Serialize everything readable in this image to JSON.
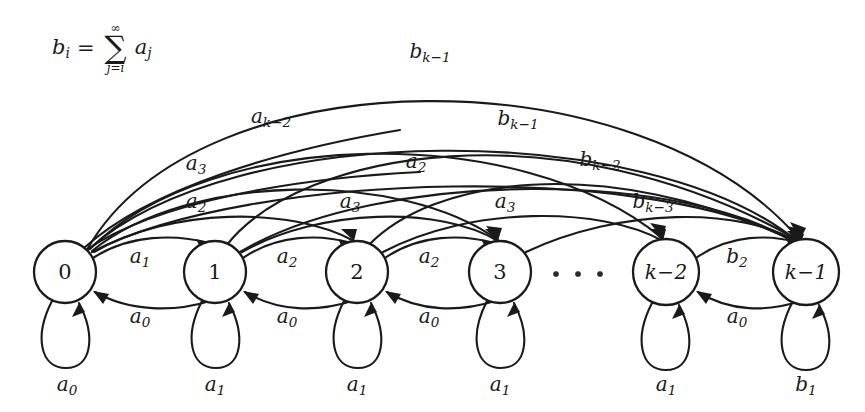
{
  "figure": {
    "background_color": "#ffffff",
    "stroke_color": "#1a1a1a"
  },
  "formula": {
    "lhs_var": "b",
    "lhs_sub": "i",
    "equals": "=",
    "sigma": "∑",
    "upper_limit": "∞",
    "lower_limit": "j=i",
    "term_var": "a",
    "term_sub": "j",
    "plain": "b_i = sum_{j=i}^{infinity} a_j"
  },
  "nodes": [
    {
      "id": "n0",
      "label": "0",
      "label_kind": "plain",
      "cx": 65,
      "cy": 272,
      "r": 31
    },
    {
      "id": "n1",
      "label": "1",
      "label_kind": "plain",
      "cx": 215,
      "cy": 272,
      "r": 31
    },
    {
      "id": "n2",
      "label": "2",
      "label_kind": "plain",
      "cx": 357,
      "cy": 272,
      "r": 31
    },
    {
      "id": "n3",
      "label": "3",
      "label_kind": "plain",
      "cx": 500,
      "cy": 272,
      "r": 31
    },
    {
      "id": "nk2",
      "label": "k−2",
      "label_kind": "math",
      "cx": 666,
      "cy": 272,
      "r": 33
    },
    {
      "id": "nk1",
      "label": "k−1",
      "label_kind": "math",
      "cx": 806,
      "cy": 272,
      "r": 33
    }
  ],
  "ellipsis": {
    "label": "· · ·",
    "dots": 3,
    "cx": 577,
    "cy": 274
  },
  "forward_edges": [
    {
      "from": "0",
      "to": "1",
      "var": "a",
      "sub": "1",
      "lx": 140,
      "ly": 258
    },
    {
      "from": "1",
      "to": "2",
      "var": "a",
      "sub": "2",
      "lx": 287,
      "ly": 258
    },
    {
      "from": "2",
      "to": "3",
      "var": "a",
      "sub": "2",
      "lx": 429,
      "ly": 258
    },
    {
      "from": "k-2",
      "to": "k-1",
      "var": "b",
      "sub": "2",
      "lx": 737,
      "ly": 258
    }
  ],
  "backward_edges": [
    {
      "from": "1",
      "to": "0",
      "var": "a",
      "sub": "0",
      "lx": 140,
      "ly": 318
    },
    {
      "from": "2",
      "to": "1",
      "var": "a",
      "sub": "0",
      "lx": 287,
      "ly": 318
    },
    {
      "from": "3",
      "to": "2",
      "var": "a",
      "sub": "0",
      "lx": 429,
      "ly": 318
    },
    {
      "from": "k-1",
      "to": "k-2",
      "var": "a",
      "sub": "0",
      "lx": 737,
      "ly": 318
    }
  ],
  "self_loops": [
    {
      "node": "0",
      "var": "a",
      "sub": "0",
      "lx": 67,
      "ly": 386
    },
    {
      "node": "1",
      "var": "a",
      "sub": "1",
      "lx": 215,
      "ly": 386
    },
    {
      "node": "2",
      "var": "a",
      "sub": "1",
      "lx": 357,
      "ly": 386
    },
    {
      "node": "3",
      "var": "a",
      "sub": "1",
      "lx": 500,
      "ly": 386
    },
    {
      "node": "k-2",
      "var": "a",
      "sub": "1",
      "lx": 666,
      "ly": 386
    },
    {
      "node": "k-1",
      "var": "b",
      "sub": "1",
      "lx": 806,
      "ly": 386
    }
  ],
  "arc_labels": [
    {
      "id": "arc-bk1-top",
      "var": "b",
      "sub": "k−1",
      "lx": 430,
      "ly": 53,
      "tier": 1
    },
    {
      "id": "arc-ak2",
      "var": "a",
      "sub": "k−2",
      "lx": 271,
      "ly": 118,
      "tier": 2
    },
    {
      "id": "arc-bk1-mid",
      "var": "b",
      "sub": "k−1",
      "lx": 518,
      "ly": 120,
      "tier": 2
    },
    {
      "id": "arc-a3-left",
      "var": "a",
      "sub": "3",
      "lx": 196,
      "ly": 165,
      "tier": 3
    },
    {
      "id": "arc-a2-mid",
      "var": "a",
      "sub": "2",
      "lx": 416,
      "ly": 163,
      "tier": 3
    },
    {
      "id": "arc-bk2",
      "var": "b",
      "sub": "k−2",
      "lx": 600,
      "ly": 161,
      "tier": 3
    },
    {
      "id": "arc-a2-left",
      "var": "a",
      "sub": "2",
      "lx": 196,
      "ly": 203,
      "tier": 4
    },
    {
      "id": "arc-a3-mid",
      "var": "a",
      "sub": "3",
      "lx": 350,
      "ly": 203,
      "tier": 4
    },
    {
      "id": "arc-a3-right",
      "var": "a",
      "sub": "3",
      "lx": 505,
      "ly": 203,
      "tier": 4
    },
    {
      "id": "arc-bk3",
      "var": "b",
      "sub": "k−3",
      "lx": 653,
      "ly": 203,
      "tier": 4
    }
  ]
}
